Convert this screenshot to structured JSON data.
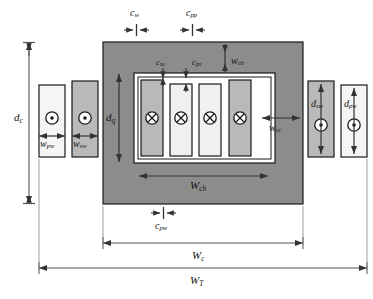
{
  "figure": {
    "type": "engineering-cross-section-diagram",
    "background": "#ffffff"
  },
  "colors": {
    "core_fill": "#8c8c8c",
    "window_fill": "#ffffff",
    "winding_dark": "#b9b9b9",
    "winding_light": "#f0f0f0",
    "outline": "#1a1a1a",
    "dimension_line": "#555555",
    "text": "#111111"
  },
  "shapes": {
    "core": {
      "name": "magnetic-core",
      "x": 103,
      "y": 42,
      "w": 200,
      "h": 162,
      "fill": "#8c8c8c"
    },
    "window": {
      "name": "core-window",
      "x": 134,
      "y": 73,
      "w": 141,
      "h": 90,
      "fill": "#ffffff"
    },
    "inner_windings": [
      {
        "name": "secondary-winding-left",
        "x": 141,
        "y": 80,
        "w": 22,
        "h": 76,
        "fill": "#b9b9b9",
        "marker": "cross"
      },
      {
        "name": "primary-winding-inner-1",
        "x": 170,
        "y": 84,
        "w": 22,
        "h": 72,
        "fill": "#f0f0f0",
        "marker": "cross"
      },
      {
        "name": "primary-winding-inner-2",
        "x": 199,
        "y": 84,
        "w": 22,
        "h": 72,
        "fill": "#f0f0f0",
        "marker": "cross"
      },
      {
        "name": "secondary-winding-right",
        "x": 229,
        "y": 80,
        "w": 22,
        "h": 76,
        "fill": "#b9b9b9",
        "marker": "cross"
      }
    ],
    "outer_windings": [
      {
        "name": "outer-primary-winding-left",
        "x": 39,
        "y": 85,
        "w": 26,
        "h": 72,
        "fill": "#f5f5f5",
        "marker": "dot"
      },
      {
        "name": "outer-secondary-winding-left",
        "x": 72,
        "y": 81,
        "w": 26,
        "h": 76,
        "fill": "#b9b9b9",
        "marker": "dot"
      },
      {
        "name": "outer-secondary-winding-right",
        "x": 308,
        "y": 81,
        "w": 26,
        "h": 76,
        "fill": "#b9b9b9",
        "marker": "dot"
      },
      {
        "name": "outer-primary-winding-right",
        "x": 341,
        "y": 85,
        "w": 26,
        "h": 72,
        "fill": "#f5f5f5",
        "marker": "dot"
      }
    ]
  },
  "labels": {
    "c_w": {
      "base": "c",
      "sub": "w",
      "x": 130,
      "y": 8,
      "name": "label-c-w"
    },
    "c_pp": {
      "base": "c",
      "sub": "pp",
      "x": 186,
      "y": 8,
      "name": "label-c-pp"
    },
    "c_ss": {
      "base": "c",
      "sub": "ss",
      "x": 156,
      "y": 61,
      "name": "label-c-ss"
    },
    "c_ps": {
      "base": "c",
      "sub": "ps",
      "x": 192,
      "y": 61,
      "name": "label-c-ps"
    },
    "w_cb": {
      "base": "w",
      "sub": "cb",
      "x": 229,
      "y": 58,
      "name": "label-w-cb"
    },
    "d_c": {
      "base": "d",
      "sub": "c",
      "x": 17,
      "y": 112,
      "name": "label-d-c"
    },
    "d_q": {
      "base": "d",
      "sub": "q",
      "x": 107,
      "y": 114,
      "name": "label-d-q"
    },
    "w_pw": {
      "base": "w",
      "sub": "pw",
      "x": 40,
      "y": 141,
      "name": "label-w-pw"
    },
    "w_sw": {
      "base": "w",
      "sub": "sw",
      "x": 72,
      "y": 141,
      "name": "label-w-sw"
    },
    "w_cc": {
      "base": "w",
      "sub": "cc",
      "x": 271,
      "y": 125,
      "name": "label-w-cc"
    },
    "d_sw": {
      "base": "d",
      "sub": "sw",
      "x": 312,
      "y": 101,
      "name": "label-d-sw"
    },
    "d_pw": {
      "base": "d",
      "sub": "pw",
      "x": 345,
      "y": 101,
      "name": "label-d-pw"
    },
    "W_cb": {
      "base": "W",
      "sub": "cb",
      "x": 190,
      "y": 183,
      "name": "label-big-w-cb"
    },
    "c_pw": {
      "base": "c",
      "sub": "pw",
      "x": 154,
      "y": 222,
      "name": "label-c-pw"
    },
    "W_c": {
      "base": "W",
      "sub": "c",
      "x": 182,
      "y": 252,
      "name": "label-big-w-c"
    },
    "W_T": {
      "base": "W",
      "sub": "T",
      "x": 182,
      "y": 277,
      "name": "label-big-w-t"
    }
  },
  "markers": {
    "dot_legend": "current out of page (dot)",
    "cross_legend": "current into page (cross)"
  }
}
